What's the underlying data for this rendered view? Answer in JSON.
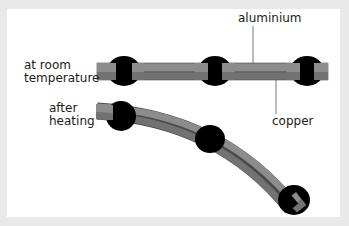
{
  "diagram": {
    "labels": {
      "aluminium": "aluminium",
      "copper": "copper",
      "room_line1": "at room",
      "room_line2": "temperature",
      "heat_line1": "after",
      "heat_line2": "heating"
    },
    "colors": {
      "frame": "#e9e9e9",
      "background": "#ffffff",
      "aluminium": "#8a8a8a",
      "copper": "#6e6e6e",
      "clamp": "#000000",
      "leader": "#555555"
    }
  }
}
